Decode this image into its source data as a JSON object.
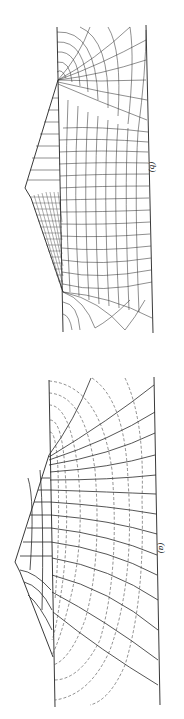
{
  "figure": {
    "orientation": "rotated 90 degrees clockwise",
    "panels": [
      {
        "id": "b",
        "label": "(b)",
        "description": "Flow net beneath an embankment with refined mesh near upstream face; solid curvilinear grid",
        "line_style": "solid"
      },
      {
        "id": "a",
        "label": "(a)",
        "description": "Flow net beneath an embankment; solid flow lines with dashed equipotential arcs",
        "line_style": "solid and dashed"
      }
    ],
    "colors": {
      "background": "#ffffff",
      "lines": "#2a2a2a"
    }
  }
}
